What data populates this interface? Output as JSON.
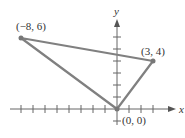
{
  "diagram": {
    "type": "coordinate-plane-triangle",
    "axes": {
      "x_label": "x",
      "y_label": "y",
      "x_ticks": [
        -8,
        -7,
        -6,
        -5,
        -4,
        -3,
        -2,
        -1,
        1,
        2,
        3
      ],
      "y_ticks": [
        -1,
        1,
        2,
        3,
        4,
        5,
        6
      ]
    },
    "points": [
      {
        "coords": [
          -8,
          6
        ],
        "label": "(−8, 6)"
      },
      {
        "coords": [
          3,
          4
        ],
        "label": "(3, 4)"
      },
      {
        "coords": [
          0,
          0
        ],
        "label": "(0, 0)"
      }
    ],
    "colors": {
      "triangle": "#808080",
      "axes": "#555555",
      "text": "#333333"
    }
  }
}
